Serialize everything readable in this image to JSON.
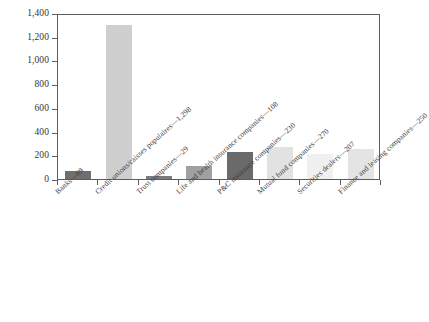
{
  "chart_data": {
    "type": "bar",
    "title": "",
    "subtitle": "",
    "xlabel": "",
    "ylabel": "",
    "ylim": [
      0,
      1400
    ],
    "ytick_values": [
      0,
      200,
      400,
      600,
      800,
      1000,
      1200,
      1400
    ],
    "ytick_labels": [
      "0",
      "200",
      "400",
      "600",
      "800",
      "1,000",
      "1,200",
      "1,400"
    ],
    "grid": false,
    "legend": "none",
    "categories": [
      "Banks—69",
      "Credit unions/caisses populaires—1,298",
      "Trust companies—29",
      "Life and health insurance companies—108",
      "P&C insurance companies—230",
      "Mutual fund companies—270",
      "Securities dealers—207",
      "Finance and leasing companies—250"
    ],
    "values": [
      69,
      1298,
      29,
      108,
      230,
      270,
      207,
      250
    ],
    "bar_colors": [
      "#6f6f6f",
      "#cfcfcf",
      "#7b7b7b",
      "#a0a0a0",
      "#6a6a6a",
      "#e2e2e2",
      "#f0f0f0",
      "#e4e4e4"
    ],
    "axis_color": "#5d5d5d"
  }
}
